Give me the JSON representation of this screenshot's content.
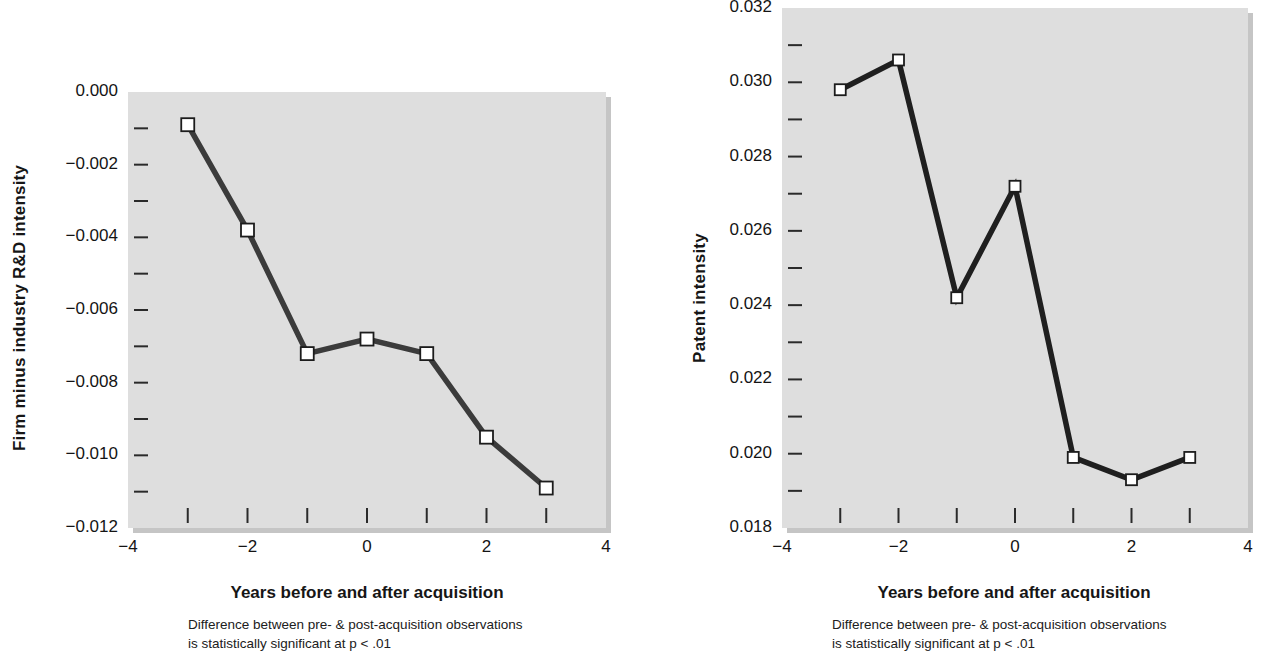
{
  "figure": {
    "background_color": "#ffffff",
    "plot_background_color": "#dedede",
    "line_color": "#3b3b3b",
    "marker_fill": "#ffffff",
    "marker_stroke": "#1c1c1c"
  },
  "chart_data": [
    {
      "type": "line",
      "panel": "left",
      "title": "",
      "xlabel": "Years before and after acquisition",
      "ylabel": "Firm minus industry R&D intensity",
      "caption_line1": "Difference between pre- & post-acquisition observations",
      "caption_line2": "is statistically significant at p < .01",
      "x": [
        -3,
        -2,
        -1,
        0,
        1,
        2,
        3
      ],
      "values": [
        -0.0009,
        -0.0038,
        -0.0072,
        -0.0068,
        -0.0072,
        -0.0095,
        -0.0109
      ],
      "xlim": [
        -4,
        4
      ],
      "ylim": [
        -0.012,
        0.0
      ],
      "xticks": [
        -3,
        -2,
        -1,
        0,
        1,
        2,
        3
      ],
      "xtick_labels": [
        "-4",
        "-2",
        "0",
        "2",
        "4"
      ],
      "xtick_label_values": [
        -4,
        -2,
        0,
        2,
        4
      ],
      "yticks": [
        0.0,
        -0.001,
        -0.002,
        -0.003,
        -0.004,
        -0.005,
        -0.006,
        -0.007,
        -0.008,
        -0.009,
        -0.01,
        -0.011,
        -0.012
      ],
      "ytick_labels": [
        "0.000",
        "−0.002",
        "−0.004",
        "−0.006",
        "−0.008",
        "−0.010",
        "−0.012"
      ],
      "ytick_label_values": [
        0.0,
        -0.002,
        -0.004,
        -0.006,
        -0.008,
        -0.01,
        -0.012
      ],
      "grid": false,
      "legend": "none"
    },
    {
      "type": "line",
      "panel": "right",
      "title": "",
      "xlabel": "Years before and after acquisition",
      "ylabel": "Patent intensity",
      "caption_line1": "Difference between pre- & post-acquisition observations",
      "caption_line2": "is statistically significant at p < .01",
      "x": [
        -3,
        -2,
        -1,
        0,
        1,
        2,
        3
      ],
      "values": [
        0.0298,
        0.0306,
        0.0242,
        0.0272,
        0.0199,
        0.0193,
        0.0199
      ],
      "xlim": [
        -4,
        4
      ],
      "ylim": [
        0.018,
        0.032
      ],
      "xticks": [
        -3,
        -2,
        -1,
        0,
        1,
        2,
        3
      ],
      "xtick_labels": [
        "-4",
        "-2",
        "0",
        "2",
        "4"
      ],
      "xtick_label_values": [
        -4,
        -2,
        0,
        2,
        4
      ],
      "yticks": [
        0.032,
        0.031,
        0.03,
        0.029,
        0.028,
        0.027,
        0.026,
        0.025,
        0.024,
        0.023,
        0.022,
        0.021,
        0.02,
        0.019,
        0.018
      ],
      "ytick_labels": [
        "0.032",
        "0.030",
        "0.028",
        "0.026",
        "0.024",
        "0.022",
        "0.020",
        "0.018"
      ],
      "ytick_label_values": [
        0.032,
        0.03,
        0.028,
        0.026,
        0.024,
        0.022,
        0.02,
        0.018
      ],
      "grid": false,
      "legend": "none"
    }
  ]
}
